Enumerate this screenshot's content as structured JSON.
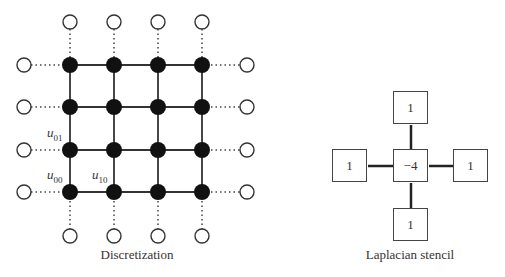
{
  "discretization": {
    "caption": "Discretization",
    "columns_x": [
      70,
      114,
      158,
      202
    ],
    "rows_y": [
      65,
      107,
      150,
      192
    ],
    "ghost_top_y": 22,
    "ghost_bottom_y": 236,
    "ghost_left_x": 24,
    "ghost_right_x": 247,
    "labels": [
      {
        "var": "u",
        "sub": "01",
        "x": 47,
        "y": 133
      },
      {
        "var": "u",
        "sub": "00",
        "x": 47,
        "y": 175
      },
      {
        "var": "u",
        "sub": "10",
        "x": 92,
        "y": 175
      }
    ]
  },
  "stencil": {
    "caption": "Laplacian stencil",
    "top": "1",
    "left": "1",
    "center": "−4",
    "right": "1",
    "bottom": "1"
  },
  "colors": {
    "node_fill": "#111111",
    "line": "#333333",
    "ghost_stroke": "#333333"
  }
}
